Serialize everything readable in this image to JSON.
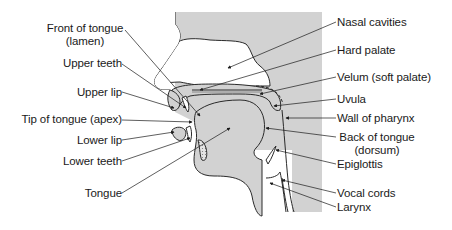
{
  "diagram": {
    "colors": {
      "background": "#ffffff",
      "tissue_fill": "#d2d2d2",
      "outline": "#2a2a2a",
      "text": "#1a1a1a"
    },
    "labels_left": [
      {
        "id": "front-of-tongue",
        "line1": "Front of tongue",
        "line2": "(lamen)"
      },
      {
        "id": "upper-teeth",
        "line1": "Upper teeth"
      },
      {
        "id": "upper-lip",
        "line1": "Upper lip"
      },
      {
        "id": "tip-of-tongue",
        "line1": "Tip of tongue (apex)"
      },
      {
        "id": "lower-lip",
        "line1": "Lower lip"
      },
      {
        "id": "lower-teeth",
        "line1": "Lower teeth"
      },
      {
        "id": "tongue",
        "line1": "Tongue"
      }
    ],
    "labels_right": [
      {
        "id": "nasal-cavities",
        "line1": "Nasal cavities"
      },
      {
        "id": "hard-palate",
        "line1": "Hard palate"
      },
      {
        "id": "velum",
        "line1": "Velum (soft palate)"
      },
      {
        "id": "uvula",
        "line1": "Uvula"
      },
      {
        "id": "wall-of-pharynx",
        "line1": "Wall of pharynx"
      },
      {
        "id": "back-of-tongue",
        "line1": "Back of tongue",
        "line2": "(dorsum)"
      },
      {
        "id": "epiglottis",
        "line1": "Epiglottis"
      },
      {
        "id": "vocal-cords",
        "line1": "Vocal cords"
      },
      {
        "id": "larynx",
        "line1": "Larynx"
      }
    ]
  }
}
